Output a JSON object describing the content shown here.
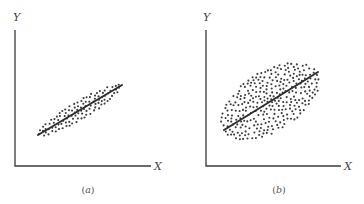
{
  "chart_data": [
    {
      "type": "scatter",
      "panel": "a",
      "caption": "(a)",
      "caption_letter": "a",
      "xlabel": "X",
      "ylabel": "Y",
      "title": "",
      "grid": false,
      "description": "Strong positive correlation: points tightly clustered around an upward-sloping regression line",
      "regression_line": {
        "x1": 38,
        "y1": 135,
        "x2": 122,
        "y2": 85
      },
      "cloud": {
        "cx": 80,
        "cy": 110,
        "along": 48,
        "across": 9,
        "count": 150,
        "seed": 7
      },
      "axes": {
        "origin_x": 15,
        "origin_y": 166,
        "y_top": 30,
        "x_right": 151
      },
      "label_pos": {
        "y": {
          "x": 13,
          "y": 21
        },
        "x": {
          "x": 154,
          "y": 170
        },
        "caption": {
          "x": 88,
          "y": 193
        }
      }
    },
    {
      "type": "scatter",
      "panel": "b",
      "caption": "(b)",
      "caption_letter": "b",
      "xlabel": "X",
      "ylabel": "Y",
      "title": "",
      "grid": false,
      "description": "Weak positive correlation: points widely scattered in an elliptical cloud around an upward-sloping regression line",
      "regression_line": {
        "x1": 224,
        "y1": 130,
        "x2": 318,
        "y2": 72
      },
      "cloud": {
        "cx": 270,
        "cy": 101,
        "along": 55,
        "across": 30,
        "count": 300,
        "seed": 21
      },
      "axes": {
        "origin_x": 206,
        "origin_y": 166,
        "y_top": 30,
        "x_right": 341
      },
      "label_pos": {
        "y": {
          "x": 203,
          "y": 21
        },
        "x": {
          "x": 344,
          "y": 170
        },
        "caption": {
          "x": 279,
          "y": 193
        }
      }
    }
  ],
  "colors": {
    "ink": "#3a3a3a",
    "dots": "#3c3c3c",
    "background": "#ffffff"
  }
}
